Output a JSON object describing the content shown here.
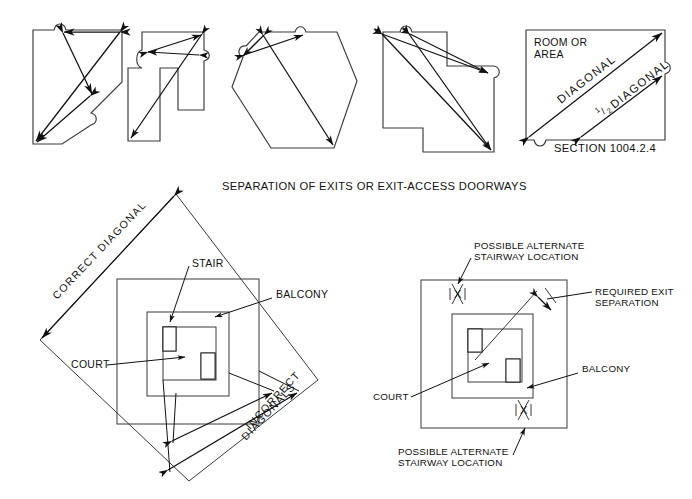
{
  "figure": {
    "title": "Separation of Exits or Exit-Access Doorways",
    "background_color": "#ffffff",
    "line_color": "#3a3a3a",
    "arrow_color": "#111111"
  },
  "top_row": {
    "caption": "SEPARATION OF EXITS OR EXIT-ACCESS DOORWAYS",
    "shapes": [
      {
        "name": "square-with-cut-corner",
        "doorways": 3
      },
      {
        "name": "stepped-t-shape",
        "doorways": 3
      },
      {
        "name": "hexagon",
        "doorways": 3
      },
      {
        "name": "l-shape-with-notch",
        "doorways": 3
      }
    ],
    "room_box": {
      "label_line1": "ROOM OR",
      "label_line2": "AREA",
      "diagonal_label": "DIAGONAL",
      "half_diagonal_numerator": "1",
      "half_diagonal_denominator": "2",
      "half_diagonal_label": "DIAGONAL",
      "section_reference": "SECTION 1004.2.4"
    }
  },
  "bottom_left": {
    "correct_diagonal_label": "CORRECT  DIAGONAL",
    "incorrect_label_line1": "INCORRECT",
    "incorrect_label_line2": "DIAGONALS",
    "stair_label": "STAIR",
    "balcony_label": "BALCONY",
    "court_label": "COURT"
  },
  "bottom_right": {
    "alt_top_line1": "POSSIBLE ALTERNATE",
    "alt_top_line2": "STAIRWAY LOCATION",
    "alt_bottom_line1": "POSSIBLE ALTERNATE",
    "alt_bottom_line2": "STAIRWAY LOCATION",
    "required_sep_line1": "REQUIRED EXIT",
    "required_sep_line2": "SEPARATION",
    "balcony_label": "BALCONY",
    "court_label": "COURT",
    "stair_marker_top": "X",
    "stair_marker_bottom": "X"
  }
}
